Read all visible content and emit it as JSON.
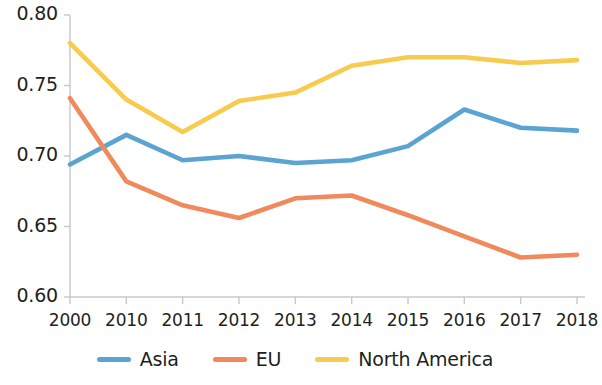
{
  "chart_data": {
    "type": "line",
    "title": "",
    "subtitle": "",
    "xlabel": "",
    "ylabel": "",
    "categories": [
      "2000",
      "2010",
      "2011",
      "2012",
      "2013",
      "2014",
      "2015",
      "2016",
      "2017",
      "2018"
    ],
    "series": [
      {
        "name": "Asia",
        "color": "#5BA3D0",
        "values": [
          0.694,
          0.715,
          0.697,
          0.7,
          0.695,
          0.697,
          0.707,
          0.733,
          0.72,
          0.718
        ]
      },
      {
        "name": "EU",
        "color": "#F08A5D",
        "values": [
          0.741,
          0.682,
          0.665,
          0.656,
          0.67,
          0.672,
          0.658,
          0.643,
          0.628,
          0.63
        ]
      },
      {
        "name": "North America",
        "color": "#F7CB4D",
        "values": [
          0.78,
          0.74,
          0.717,
          0.739,
          0.745,
          0.764,
          0.77,
          0.77,
          0.766,
          0.768
        ]
      }
    ],
    "ylim": [
      0.6,
      0.8
    ],
    "yticks": [
      "0.80",
      "0.75",
      "0.70",
      "0.65",
      "0.60"
    ],
    "ytick_values": [
      0.8,
      0.75,
      0.7,
      0.65,
      0.6
    ],
    "grid": false,
    "legend_position": "bottom",
    "legend": [
      "Asia",
      "EU",
      "North America"
    ]
  },
  "axis": {
    "color": "#c8c8c8"
  }
}
